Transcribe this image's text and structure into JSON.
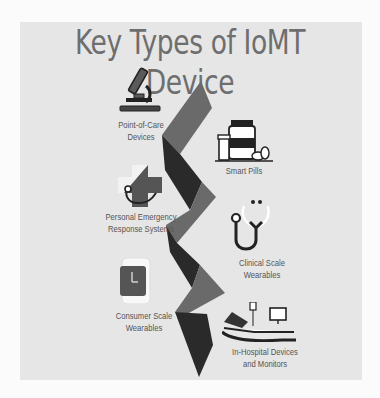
{
  "title": "Key Types of IoMT Device",
  "colors": {
    "background": "#fbfbfb",
    "panel": "#e6e6e6",
    "title": "#6e6e6e",
    "zigzag_dark": "#2a2a2a",
    "zigzag_mid": "#6a6a6a",
    "label": "#555555"
  },
  "items": [
    {
      "id": "point-of-care",
      "label_line1": "Point-of-Care",
      "label_line2": "Devices",
      "icon": "microscope-icon",
      "side": "left"
    },
    {
      "id": "smart-pills",
      "label_line1": "Smart Pills",
      "label_line2": "",
      "icon": "pill-bottle-icon",
      "side": "right"
    },
    {
      "id": "pers",
      "label_line1": "Personal Emergency",
      "label_line2": "Response Systems",
      "icon": "medical-cross-stethoscope-icon",
      "side": "left"
    },
    {
      "id": "clinical-wearables",
      "label_line1": "Clinical Scale",
      "label_line2": "Wearables",
      "icon": "stethoscope-icon",
      "side": "right"
    },
    {
      "id": "consumer-wearables",
      "label_line1": "Consumer Scale",
      "label_line2": "Wearables",
      "icon": "smartwatch-icon",
      "side": "left"
    },
    {
      "id": "in-hospital",
      "label_line1": "In-Hospital Devices",
      "label_line2": "and Monitors",
      "icon": "hospital-bed-monitor-icon",
      "side": "right"
    }
  ]
}
